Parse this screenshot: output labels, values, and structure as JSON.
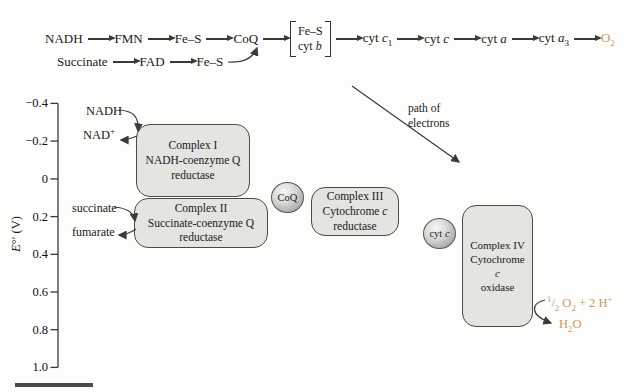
{
  "colors": {
    "accent": "#c89a62",
    "line": "#3a3a3a",
    "box_fill": "#e4e4e1"
  },
  "top_chain": {
    "row1": [
      {
        "parts": [
          {
            "t": "NADH"
          }
        ]
      },
      {
        "parts": [
          {
            "t": "FMN"
          }
        ]
      },
      {
        "parts": [
          {
            "t": "Fe–S"
          }
        ]
      },
      {
        "parts": [
          {
            "t": "CoQ"
          }
        ]
      },
      {
        "bracket": [
          [
            {
              "t": "Fe–S"
            }
          ],
          [
            {
              "t": "cyt "
            },
            {
              "t": "b",
              "i": true
            }
          ]
        ]
      },
      {
        "parts": [
          {
            "t": "cyt "
          },
          {
            "t": "c",
            "i": true
          },
          {
            "t": "1",
            "sub": true
          }
        ]
      },
      {
        "parts": [
          {
            "t": "cyt "
          },
          {
            "t": "c",
            "i": true
          }
        ]
      },
      {
        "parts": [
          {
            "t": "cyt "
          },
          {
            "t": "a",
            "i": true
          }
        ]
      },
      {
        "parts": [
          {
            "t": "cyt "
          },
          {
            "t": "a",
            "i": true
          },
          {
            "t": "3",
            "sub": true
          }
        ]
      },
      {
        "parts": [
          {
            "t": "O"
          },
          {
            "t": "2",
            "sub": true
          }
        ],
        "accent": true
      }
    ],
    "row2": [
      {
        "parts": [
          {
            "t": "Succinate"
          }
        ]
      },
      {
        "parts": [
          {
            "t": "FAD"
          }
        ]
      },
      {
        "parts": [
          {
            "t": "Fe–S"
          }
        ]
      }
    ]
  },
  "axis": {
    "title_parts": [
      {
        "t": "E",
        "i": true
      },
      {
        "t": "°′ (V)"
      }
    ],
    "ticks": [
      "−0.4",
      "−0.2",
      "0",
      "0.2",
      "0.4",
      "0.6",
      "0.8",
      "1.0"
    ]
  },
  "boxes": [
    {
      "id": "complex-1",
      "lines": [
        [
          {
            "t": "Complex I"
          }
        ],
        [
          {
            "t": "NADH-coenzyme Q"
          }
        ],
        [
          {
            "t": "reductase"
          }
        ]
      ]
    },
    {
      "id": "complex-2",
      "lines": [
        [
          {
            "t": "Complex II"
          }
        ],
        [
          {
            "t": "Succinate-coenzyme Q"
          }
        ],
        [
          {
            "t": "reductase"
          }
        ]
      ]
    },
    {
      "id": "complex-3",
      "lines": [
        [
          {
            "t": "Complex III"
          }
        ],
        [
          {
            "t": "Cytochrome "
          },
          {
            "t": "c",
            "i": true
          }
        ],
        [
          {
            "t": "reductase"
          }
        ]
      ]
    },
    {
      "id": "complex-4",
      "lines": [
        [
          {
            "t": "Complex IV"
          }
        ],
        [
          {
            "t": "Cytochrome "
          },
          {
            "t": "c",
            "i": true
          }
        ],
        [
          {
            "t": "oxidase"
          }
        ]
      ]
    }
  ],
  "circles": {
    "coq": [
      {
        "t": "CoQ"
      }
    ],
    "cytc": [
      {
        "t": "cyt "
      },
      {
        "t": "c",
        "i": true
      }
    ]
  },
  "labels": {
    "nadh": [
      {
        "t": "NADH"
      }
    ],
    "nad_plus": [
      {
        "t": "NAD"
      },
      {
        "t": "+",
        "sup": true
      }
    ],
    "succinate": [
      {
        "t": "succinate"
      }
    ],
    "fumarate": [
      {
        "t": "fumarate"
      }
    ],
    "path_of_electrons_line1": "path of",
    "path_of_electrons_line2": "electrons",
    "o2_reduction": [
      {
        "t": "1",
        "sup": true
      },
      {
        "t": "/"
      },
      {
        "t": "2",
        "sub": true
      },
      {
        "t": " O"
      },
      {
        "t": "2",
        "sub": true
      },
      {
        "t": " + 2 H"
      },
      {
        "t": "+",
        "sup": true
      }
    ],
    "h2o": [
      {
        "t": "H"
      },
      {
        "t": "2",
        "sub": true
      },
      {
        "t": "O"
      }
    ]
  }
}
